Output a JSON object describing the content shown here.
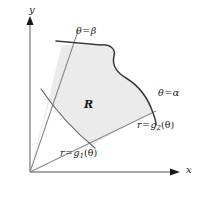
{
  "figure": {
    "kind": "polar-region-diagram",
    "background_color": "#ffffff",
    "region_fill_color": "#ebebeb",
    "curve_color": "#3a3a3a",
    "ray_color": "#8a8a8a",
    "axis_color": "#8a8a8a",
    "label_color": "#1a1a1a"
  },
  "axes": {
    "y_label": "y",
    "x_label": "x",
    "origin": {
      "x": 30,
      "y": 172
    },
    "y_axis_top": {
      "x": 30,
      "y": 18
    },
    "x_axis_right": {
      "x": 178,
      "y": 172
    }
  },
  "labels": {
    "region": "R",
    "ray_beta": {
      "theta": "θ",
      "equals": "=",
      "value": "β"
    },
    "ray_alpha": {
      "theta": "θ",
      "equals": "=",
      "value": "α"
    },
    "curve_inner": {
      "r": "r",
      "equals": "=",
      "fn": "g",
      "sub": "1",
      "arg": "(θ)"
    },
    "curve_outer": {
      "r": "r",
      "equals": "=",
      "fn": "g",
      "sub": "2",
      "arg": "(θ)"
    }
  },
  "geometry": {
    "ray_beta_end": {
      "x": 78,
      "y": 33
    },
    "ray_alpha_end": {
      "x": 154,
      "y": 112
    },
    "inner_curve_endpoints": [
      {
        "x": 44,
        "y": 93
      },
      {
        "x": 92,
        "y": 145
      }
    ],
    "outer_curve_endpoints": [
      {
        "x": 58,
        "y": 43
      },
      {
        "x": 156,
        "y": 124
      }
    ]
  }
}
